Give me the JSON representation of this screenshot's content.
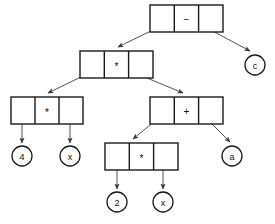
{
  "diagram": {
    "expression": "(4 * x) * (2 * x + a) - c",
    "stroke_color": "#1a1a1a",
    "line_color": "#555555",
    "background_color": "#ffffff",
    "nodes": [
      {
        "id": "root",
        "kind": "operator-box",
        "operator": "−",
        "operator_name": "minus",
        "x": 150,
        "y": 5,
        "w": 73,
        "h": 27,
        "cells": [
          "left-pointer",
          "operator",
          "right-pointer"
        ]
      },
      {
        "id": "mul-top",
        "kind": "operator-box",
        "operator": "*",
        "operator_name": "asterisk",
        "x": 80,
        "y": 51,
        "w": 73,
        "h": 27,
        "cells": [
          "left-pointer",
          "operator",
          "right-pointer"
        ]
      },
      {
        "id": "mul-left",
        "kind": "operator-box",
        "operator": "*",
        "operator_name": "asterisk",
        "x": 11,
        "y": 97,
        "w": 72,
        "h": 27,
        "cells": [
          "left-pointer",
          "operator",
          "right-pointer"
        ]
      },
      {
        "id": "plus",
        "kind": "operator-box",
        "operator": "+",
        "operator_name": "plus",
        "x": 150,
        "y": 97,
        "w": 73,
        "h": 27,
        "cells": [
          "left-pointer",
          "operator",
          "right-pointer"
        ]
      },
      {
        "id": "mul-bottom",
        "kind": "operator-box",
        "operator": "*",
        "operator_name": "asterisk",
        "x": 105,
        "y": 143,
        "w": 73,
        "h": 27,
        "cells": [
          "left-pointer",
          "operator",
          "right-pointer"
        ]
      }
    ],
    "leaves": [
      {
        "id": "leaf-c",
        "label": "c",
        "cx": 255,
        "cy": 65,
        "r": 10
      },
      {
        "id": "leaf-4",
        "label": "4",
        "cx": 22,
        "cy": 156,
        "r": 10
      },
      {
        "id": "leaf-x1",
        "label": "x",
        "cx": 70,
        "cy": 156,
        "r": 10
      },
      {
        "id": "leaf-a",
        "label": "a",
        "cx": 232,
        "cy": 156,
        "r": 10
      },
      {
        "id": "leaf-2",
        "label": "2",
        "cx": 117,
        "cy": 202,
        "r": 10
      },
      {
        "id": "leaf-x2",
        "label": "x",
        "cx": 163,
        "cy": 202,
        "r": 10
      }
    ],
    "edges": [
      {
        "from": "root-left-cell",
        "to": "mul-top",
        "style": "diagonal-arrow"
      },
      {
        "from": "root-right-cell",
        "to": "leaf-c",
        "style": "diagonal-arrow"
      },
      {
        "from": "mul-top-left-cell",
        "to": "mul-left",
        "style": "diagonal-arrow"
      },
      {
        "from": "mul-top-right-cell",
        "to": "plus",
        "style": "diagonal-arrow"
      },
      {
        "from": "mul-left-left-cell",
        "to": "leaf-4",
        "style": "vertical-arrow"
      },
      {
        "from": "mul-left-right-cell",
        "to": "leaf-x1",
        "style": "vertical-arrow"
      },
      {
        "from": "plus-left-cell",
        "to": "mul-bottom",
        "style": "diagonal-arrow"
      },
      {
        "from": "plus-right-cell",
        "to": "leaf-a",
        "style": "diagonal-arrow"
      },
      {
        "from": "mul-bottom-left-cell",
        "to": "leaf-2",
        "style": "vertical-arrow"
      },
      {
        "from": "mul-bottom-right-cell",
        "to": "leaf-x2",
        "style": "vertical-arrow"
      }
    ]
  }
}
